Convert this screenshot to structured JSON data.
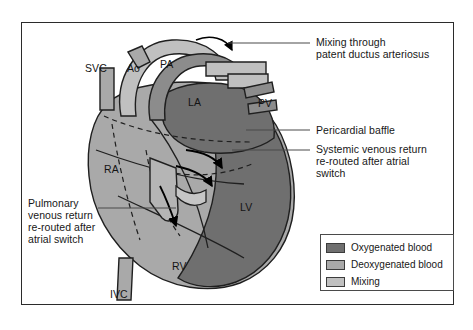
{
  "figure": {
    "anatomy_labels": [
      {
        "id": "svc",
        "text": "SVC",
        "x": 85,
        "y": 62
      },
      {
        "id": "ao",
        "text": "Ao",
        "x": 127,
        "y": 62
      },
      {
        "id": "pa",
        "text": "PA",
        "x": 160,
        "y": 58
      },
      {
        "id": "la",
        "text": "LA",
        "x": 188,
        "y": 96
      },
      {
        "id": "pv",
        "text": "PV",
        "x": 258,
        "y": 97
      },
      {
        "id": "ra",
        "text": "RA",
        "x": 104,
        "y": 163
      },
      {
        "id": "lv",
        "text": "LV",
        "x": 240,
        "y": 201
      },
      {
        "id": "rv",
        "text": "RV",
        "x": 172,
        "y": 260
      },
      {
        "id": "ivc",
        "text": "IVC",
        "x": 110,
        "y": 288
      }
    ],
    "callouts": [
      {
        "id": "ductus",
        "lines": [
          "Mixing through",
          "patent ductus arteriosus"
        ],
        "x": 316,
        "y": 36
      },
      {
        "id": "baffle",
        "lines": [
          "Pericardial baffle"
        ],
        "x": 316,
        "y": 126
      },
      {
        "id": "systemic",
        "lines": [
          "Systemic venous return",
          "re-routed after atrial",
          "switch"
        ],
        "x": 316,
        "y": 145
      },
      {
        "id": "pulmonary",
        "lines": [
          "Pulmonary",
          "venous return",
          "re-routed after",
          "atrial switch"
        ],
        "x": 28,
        "y": 199
      }
    ],
    "legend": {
      "items": [
        {
          "label": "Oxygenated blood",
          "color": "#6f6f6f"
        },
        {
          "label": "Deoxygenated blood",
          "color": "#a9a9a9"
        },
        {
          "label": "Mixing",
          "color": "#c0c0c0"
        }
      ]
    },
    "palette": {
      "oxygenated": "#6f6f6f",
      "deoxygenated": "#a9a9a9",
      "mixing": "#c0c0c0",
      "outline": "#1f1f1f",
      "frame": "#2b2b2b",
      "leader": "#4a4a4a",
      "background": "#ffffff"
    }
  }
}
